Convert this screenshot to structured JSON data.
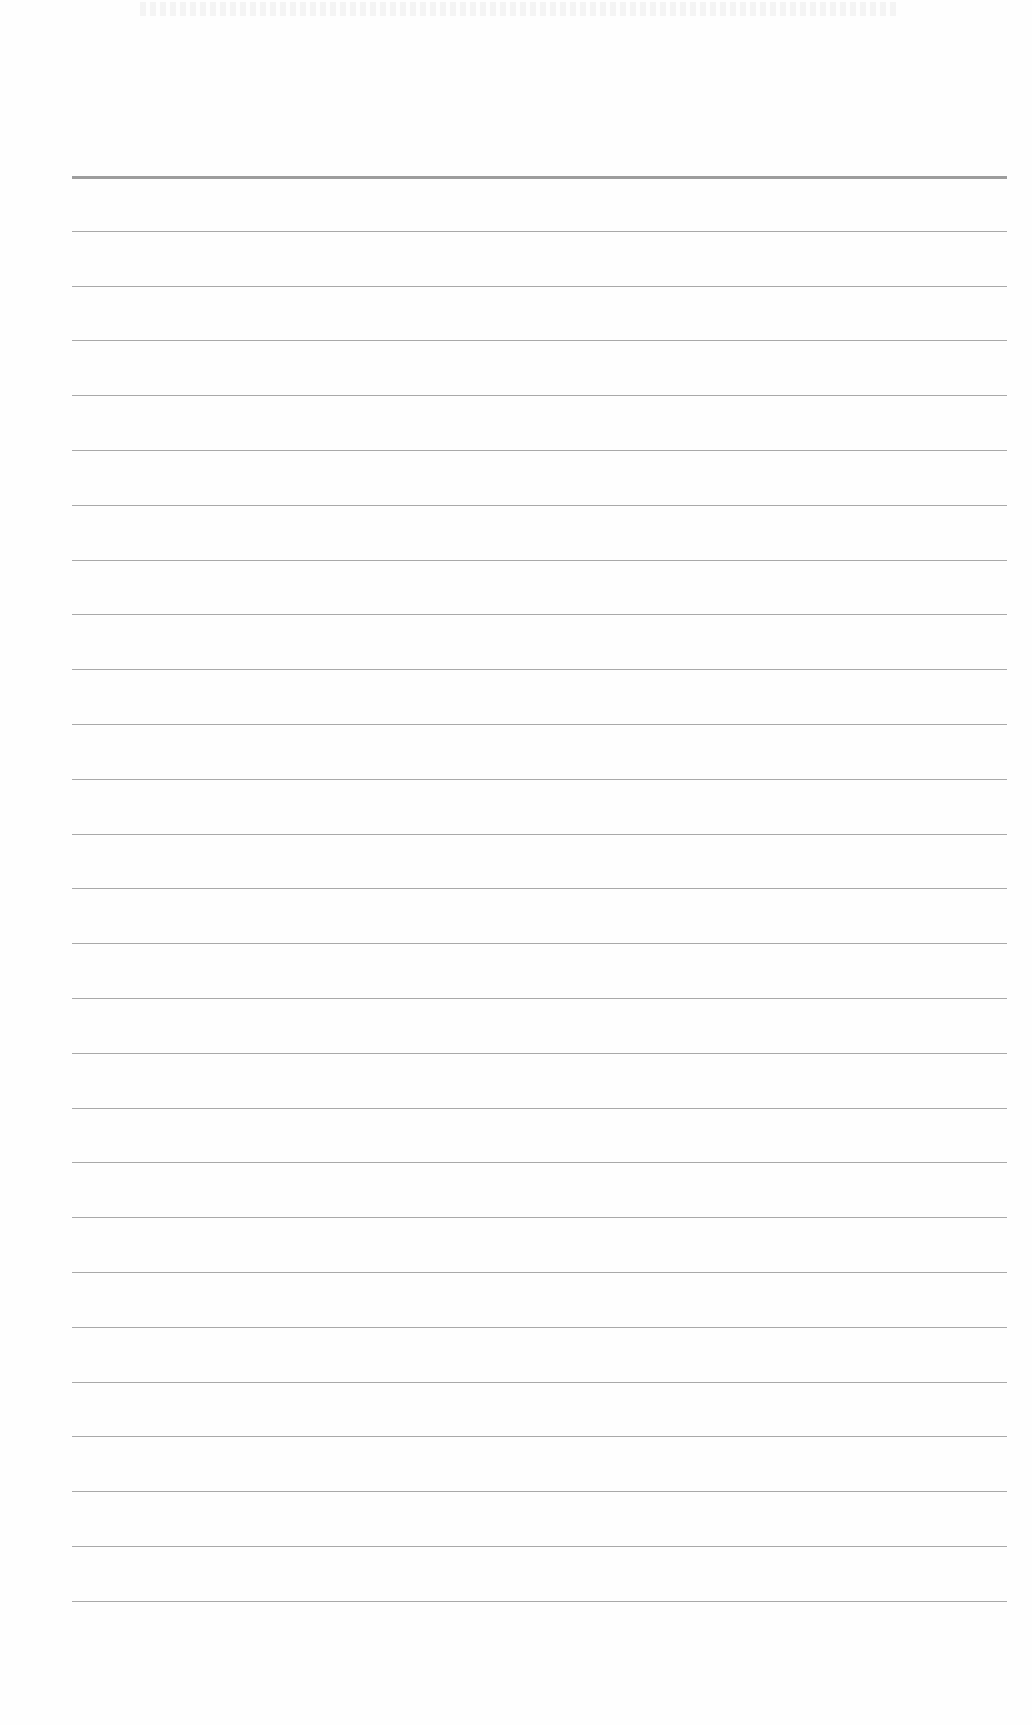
{
  "document": {
    "type": "lined-paper",
    "rule_count": 27,
    "first_rule_y": 176,
    "rule_spacing": 54.8,
    "rule_left": 72,
    "rule_width": 935,
    "rule_color": "#9a9a9a",
    "background": "#fefefe"
  }
}
